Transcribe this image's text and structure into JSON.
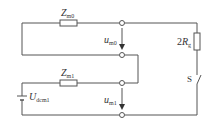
{
  "diagram": {
    "type": "circuit",
    "labels": {
      "z_m0": {
        "main": "Z",
        "sub": "m0"
      },
      "z_m1": {
        "main": "Z",
        "sub": "m1"
      },
      "u_m0": {
        "main": "u",
        "sub": "m0"
      },
      "u_m1": {
        "main": "u",
        "sub": "m1"
      },
      "u_dcm1": {
        "main": "U",
        "sub": "dcm1"
      },
      "r_g": {
        "prefix": "2",
        "main": "R",
        "sub": "g"
      },
      "switch": "S"
    },
    "colors": {
      "wire": "#555555",
      "background": "#ffffff"
    }
  }
}
